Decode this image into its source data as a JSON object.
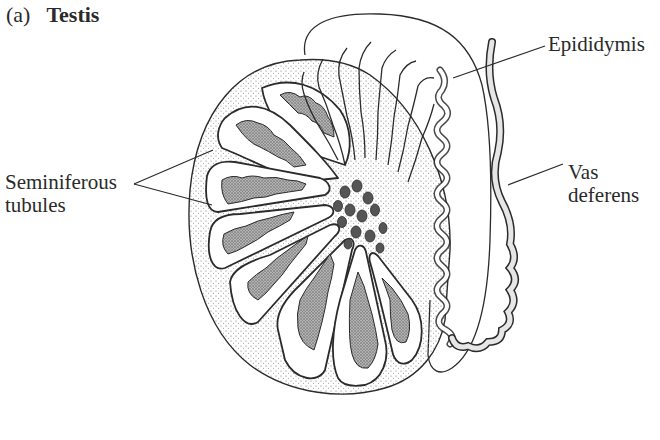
{
  "figure": {
    "panel_letter": "(a)",
    "title": "Testis"
  },
  "labels": {
    "epididymis": "Epididymis",
    "seminiferous_line1": "Seminiferous",
    "seminiferous_line2": "tubules",
    "vas_line1": "Vas",
    "vas_line2": "deferens"
  },
  "colors": {
    "ink": "#2b2b2b",
    "stipple": "#6a6a6a",
    "tubule_fill": "#9a9a9a",
    "background": "#ffffff"
  },
  "structures": [
    "testis-body",
    "tunica-albuginea",
    "lobules",
    "seminiferous-tubules",
    "rete-testis",
    "efferent-ductules",
    "epididymis",
    "vas-deferens"
  ]
}
